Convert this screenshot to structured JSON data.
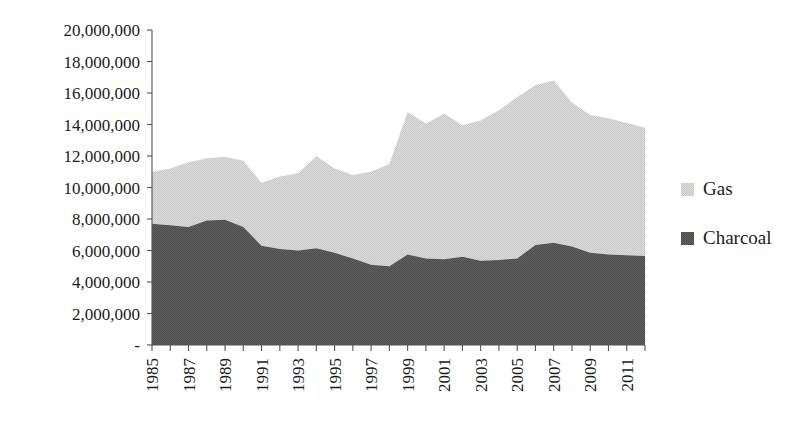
{
  "chart_data": {
    "type": "area",
    "stacked": true,
    "title": "",
    "subtitle": "",
    "xlabel": "",
    "ylabel": "",
    "grid": false,
    "legend_position": "right",
    "x": [
      1985,
      1986,
      1987,
      1988,
      1989,
      1990,
      1991,
      1992,
      1993,
      1994,
      1995,
      1996,
      1997,
      1998,
      1999,
      2000,
      2001,
      2002,
      2003,
      2004,
      2005,
      2006,
      2007,
      2008,
      2009,
      2010,
      2011,
      2012
    ],
    "categories": [
      "1985",
      "1986",
      "1987",
      "1988",
      "1989",
      "1990",
      "1991",
      "1992",
      "1993",
      "1994",
      "1995",
      "1996",
      "1997",
      "1998",
      "1999",
      "2000",
      "2001",
      "2002",
      "2003",
      "2004",
      "2005",
      "2006",
      "2007",
      "2008",
      "2009",
      "2010",
      "2011",
      "2012"
    ],
    "xtick_labels": [
      "1985",
      "1987",
      "1989",
      "1991",
      "1993",
      "1995",
      "1997",
      "1999",
      "2001",
      "2003",
      "2005",
      "2007",
      "2009",
      "2011"
    ],
    "ytick_labels": [
      "-",
      "2,000,000",
      "4,000,000",
      "6,000,000",
      "8,000,000",
      "10,000,000",
      "12,000,000",
      "14,000,000",
      "16,000,000",
      "18,000,000",
      "20,000,000"
    ],
    "ytick_values": [
      0,
      2000000,
      4000000,
      6000000,
      8000000,
      10000000,
      12000000,
      14000000,
      16000000,
      18000000,
      20000000
    ],
    "ylim": [
      0,
      20000000
    ],
    "xlim": [
      1985,
      2012
    ],
    "series": [
      {
        "name": "Charcoal",
        "color": "#5a5a5a",
        "values": [
          7700000,
          7600000,
          7500000,
          7900000,
          7950000,
          7500000,
          6300000,
          6100000,
          6000000,
          6150000,
          5850000,
          5500000,
          5100000,
          5000000,
          5750000,
          5500000,
          5450000,
          5600000,
          5350000,
          5400000,
          5500000,
          6350000,
          6500000,
          6250000,
          5850000,
          5750000,
          5700000,
          5650000
        ]
      },
      {
        "name": "Gas",
        "color": "#d2d2d2",
        "values": [
          3300000,
          3600000,
          4100000,
          3950000,
          4000000,
          4200000,
          4000000,
          4600000,
          4900000,
          5850000,
          5350000,
          5300000,
          5900000,
          6500000,
          9050000,
          8550000,
          9250000,
          8350000,
          8900000,
          9500000,
          10250000,
          10150000,
          10300000,
          9150000,
          8750000,
          8650000,
          8400000,
          8150000
        ]
      }
    ],
    "totals": [
      11000000,
      11200000,
      11600000,
      11850000,
      11950000,
      11700000,
      10300000,
      10700000,
      10900000,
      12000000,
      11200000,
      10800000,
      11000000,
      11500000,
      14800000,
      14050000,
      14700000,
      13950000,
      14250000,
      14900000,
      15750000,
      16500000,
      16800000,
      15400000,
      14600000,
      14400000,
      14100000,
      13800000
    ]
  },
  "legend": {
    "items": [
      {
        "label": "Gas",
        "color": "#d2d2d2"
      },
      {
        "label": "Charcoal",
        "color": "#5a5a5a"
      }
    ]
  },
  "colors": {
    "gas": "#d2d2d2",
    "charcoal": "#5a5a5a",
    "axis": "#555555",
    "text": "#1c1c1c",
    "background": "#ffffff"
  }
}
